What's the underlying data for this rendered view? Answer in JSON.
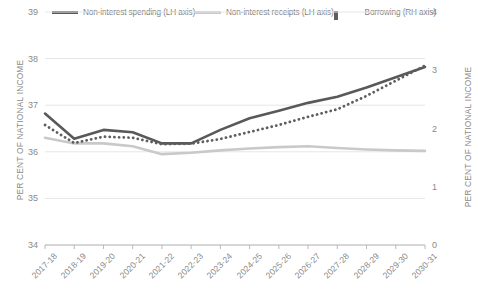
{
  "legend": {
    "entries": [
      {
        "label": "Non-interest spending (LH axis)",
        "style": "solid-dark",
        "color": "#595959"
      },
      {
        "label": "Non-interest receipts (LH axis)",
        "style": "solid-light",
        "color": "#c9c9c9"
      },
      {
        "label": "Borrowing (RH axis)",
        "style": "dotted-dark",
        "color": "#5e5e5e"
      }
    ]
  },
  "axes": {
    "left_title": "PER CENT OF NATIONAL INCOME",
    "right_title": "PER CENT OF NATIONAL INCOME",
    "left_ticks": [
      "39",
      "38",
      "37",
      "36",
      "35",
      "34"
    ],
    "right_ticks": [
      "4",
      "3",
      "2",
      "1",
      "0"
    ]
  },
  "chart_data": {
    "type": "line",
    "title": "",
    "xlabel": "",
    "ylabel": "PER CENT OF NATIONAL INCOME",
    "y2label": "PER CENT OF NATIONAL INCOME",
    "ylim": [
      34,
      39
    ],
    "y2lim": [
      0,
      4
    ],
    "grid": true,
    "legend_position": "top",
    "categories": [
      "2017-18",
      "2018-19",
      "2019-20",
      "2020-21",
      "2021-22",
      "2022-23",
      "2023-24",
      "2024-25",
      "2025-26",
      "2026-27",
      "2027-28",
      "2028-29",
      "2029-30",
      "2030-31"
    ],
    "series": [
      {
        "name": "Non-interest spending (LH axis)",
        "axis": "left",
        "style": "solid",
        "color": "#595959",
        "values": [
          36.82,
          36.28,
          36.47,
          36.42,
          36.18,
          36.18,
          36.47,
          36.72,
          36.88,
          37.05,
          37.18,
          37.38,
          37.6,
          37.82
        ]
      },
      {
        "name": "Non-interest receipts (LH axis)",
        "axis": "left",
        "style": "solid",
        "color": "#c9c9c9",
        "values": [
          36.3,
          36.18,
          36.18,
          36.12,
          35.95,
          35.98,
          36.03,
          36.07,
          36.1,
          36.12,
          36.08,
          36.05,
          36.03,
          36.02
        ]
      },
      {
        "name": "Borrowing (RH axis)",
        "axis": "right",
        "style": "dotted",
        "color": "#5e5e5e",
        "values": [
          2.06,
          1.75,
          1.86,
          1.84,
          1.73,
          1.74,
          1.82,
          1.94,
          2.06,
          2.2,
          2.33,
          2.56,
          2.82,
          3.08
        ]
      }
    ]
  }
}
